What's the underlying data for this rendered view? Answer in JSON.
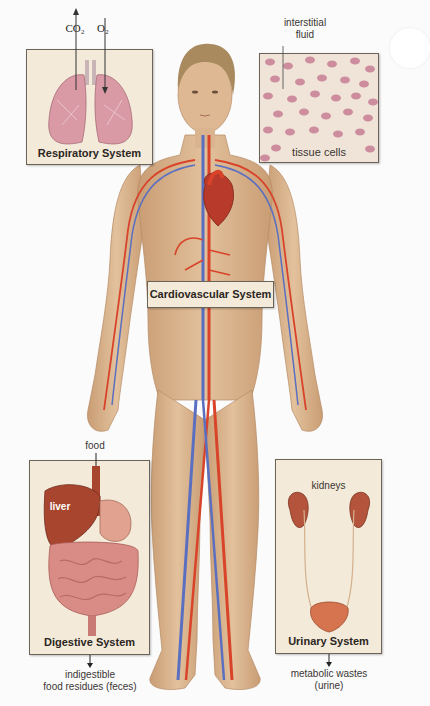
{
  "figure": {
    "type": "human body organ systems diagram",
    "panels": [
      {
        "id": "respiratory",
        "title": "Respiratory System",
        "labels": [
          "CO₂",
          "O₂"
        ]
      },
      {
        "id": "tissue",
        "title": "tissue cells",
        "labels": [
          "interstitial",
          "fluid"
        ]
      },
      {
        "id": "cardiovascular",
        "title": "Cardiovascular System",
        "labels": []
      },
      {
        "id": "digestive",
        "title": "Digestive System",
        "labels": [
          "food",
          "liver"
        ],
        "output": [
          "indigestible",
          "food residues (feces)"
        ]
      },
      {
        "id": "urinary",
        "title": "Urinary System",
        "labels": [
          "kidneys"
        ],
        "output": [
          "metabolic wastes",
          "(urine)"
        ]
      }
    ]
  },
  "respiratory": {
    "title": "Respiratory System",
    "co2": "CO₂",
    "o2": "O₂"
  },
  "tissue": {
    "label_line1": "interstitial",
    "label_line2": "fluid",
    "cells_label": "tissue cells"
  },
  "cardiovascular": {
    "title": "Cardiovascular System"
  },
  "digestive": {
    "title": "Digestive System",
    "food": "food",
    "liver": "liver",
    "out_line1": "indigestible",
    "out_line2": "food residues (feces)"
  },
  "urinary": {
    "title": "Urinary System",
    "kidneys": "kidneys",
    "out_line1": "metabolic wastes",
    "out_line2": "(urine)"
  },
  "colors": {
    "skin": "#d9b48e",
    "artery": "#d8432a",
    "vein": "#5a6fc0",
    "box_bg": "#f3ead9",
    "box_border": "#6b6358",
    "lung": "#d99aa6",
    "organ": "#a8452f",
    "hair": "#a88a5e"
  }
}
